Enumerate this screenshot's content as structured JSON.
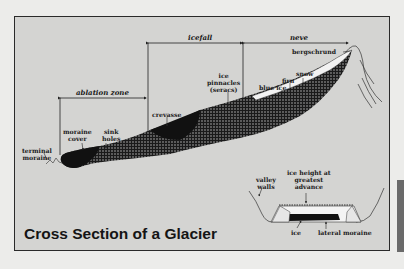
{
  "title": "Cross Section of a Glacier",
  "zones": {
    "ablation": "ablation zone",
    "icefall": "icefall",
    "neve": "neve"
  },
  "labels": {
    "terminal_moraine": [
      "terminal",
      "moraine"
    ],
    "moraine_cover": [
      "moraine",
      "cover"
    ],
    "sink_holes": [
      "sink",
      "holes"
    ],
    "crevasse": "crevasse",
    "ice_pinnacles": [
      "ice",
      "pinnacles",
      "(seracs)"
    ],
    "blue_ice": "blue ice",
    "firn": "firn",
    "snow": "snow",
    "bergschrund": "bergschrund"
  },
  "inset": {
    "valley_walls": [
      "valley",
      "walls"
    ],
    "ice_height": [
      "ice height at",
      "greatest",
      "advance"
    ],
    "ice": "ice",
    "lateral_moraine": "lateral moraine"
  },
  "colors": {
    "frame_bg": "#d4d4d2",
    "page_bg": "#ececea",
    "glacier": "#111111",
    "ink": "#1a1a1a"
  }
}
